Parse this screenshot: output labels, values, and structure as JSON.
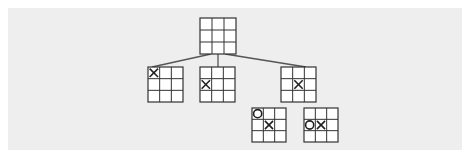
{
  "diagram": {
    "colors": {
      "background": "#eeeeee",
      "line": "#555555",
      "grid": "#333333",
      "mark": "#222222"
    },
    "nodes": [
      {
        "id": "root",
        "x": 200,
        "y": 18,
        "size": 36,
        "cells": [
          "",
          "",
          "",
          "",
          "",
          "",
          "",
          "",
          ""
        ]
      },
      {
        "id": "child-1",
        "x": 148,
        "y": 67,
        "size": 35,
        "cells": [
          "X",
          "",
          "",
          "",
          "",
          "",
          "",
          "",
          ""
        ]
      },
      {
        "id": "child-2",
        "x": 200,
        "y": 67,
        "size": 35,
        "cells": [
          "",
          "",
          "",
          "X",
          "",
          "",
          "",
          "",
          ""
        ]
      },
      {
        "id": "child-3",
        "x": 281,
        "y": 67,
        "size": 35,
        "cells": [
          "",
          "",
          "",
          "",
          "X",
          "",
          "",
          "",
          ""
        ]
      },
      {
        "id": "grandchild-1",
        "x": 252,
        "y": 108,
        "size": 34,
        "cells": [
          "O",
          "",
          "",
          "",
          "X",
          "",
          "",
          "",
          ""
        ]
      },
      {
        "id": "grandchild-2",
        "x": 304,
        "y": 108,
        "size": 34,
        "cells": [
          "",
          "",
          "",
          "O",
          "X",
          "",
          "",
          "",
          ""
        ]
      }
    ],
    "edges": [
      {
        "from": "root",
        "to": "child-1",
        "x1": 211,
        "y1": 54,
        "x2": 152,
        "y2": 67
      },
      {
        "from": "root",
        "to": "child-2",
        "x1": 218,
        "y1": 54,
        "x2": 218,
        "y2": 67
      },
      {
        "from": "root",
        "to": "child-3",
        "x1": 225,
        "y1": 54,
        "x2": 306,
        "y2": 67
      }
    ]
  }
}
